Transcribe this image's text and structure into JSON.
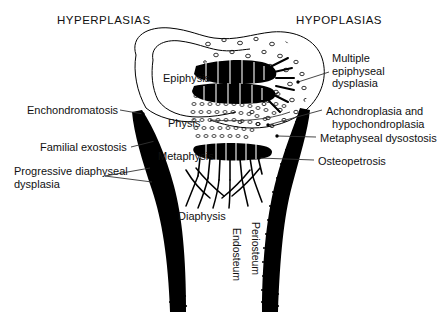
{
  "diagram": {
    "title_left": "HYPERPLASIAS",
    "title_right": "HYPOPLASIAS",
    "colors": {
      "ink": "#000000",
      "background": "#ffffff",
      "text": "#111111"
    }
  },
  "anatomy_labels": [
    {
      "id": "epiphysis",
      "text": "Epiphysis",
      "x": 163,
      "y": 72
    },
    {
      "id": "physis",
      "text": "Physis",
      "x": 168,
      "y": 117
    },
    {
      "id": "metaphysis",
      "text": "Metaphysis",
      "x": 158,
      "y": 150
    },
    {
      "id": "diaphysis",
      "text": "Diaphysis",
      "x": 178,
      "y": 210
    }
  ],
  "vertical_labels": [
    {
      "id": "endosteum",
      "text": "Endosteum",
      "x": 243,
      "y": 228
    },
    {
      "id": "periosteum",
      "text": "Periosteum",
      "x": 262,
      "y": 222
    }
  ],
  "left_callouts": [
    {
      "id": "enchondromatosis",
      "text": "Enchondromatosis",
      "x": 27,
      "y": 110
    },
    {
      "id": "familial-exostosis",
      "text": "Familial exostosis",
      "x": 40,
      "y": 147
    },
    {
      "id": "progressive-diaphyseal-dysplasia",
      "text": "Progressive diaphyseal\ndysplasia",
      "x": 14,
      "y": 171
    }
  ],
  "right_callouts": [
    {
      "id": "multiple-epiphyseal-dysplasia",
      "text": "Multiple\nepiphyseal\ndysplasia",
      "x": 332,
      "y": 52
    },
    {
      "id": "achondroplasia-hypochondroplasia",
      "text": "Achondroplasia and\n  hypochondroplasia",
      "x": 326,
      "y": 105
    },
    {
      "id": "metaphyseal-dysostosis",
      "text": "Metaphyseal dysostosis",
      "x": 320,
      "y": 138
    },
    {
      "id": "osteopetrosis",
      "text": "Osteopetrosis",
      "x": 318,
      "y": 161
    }
  ]
}
